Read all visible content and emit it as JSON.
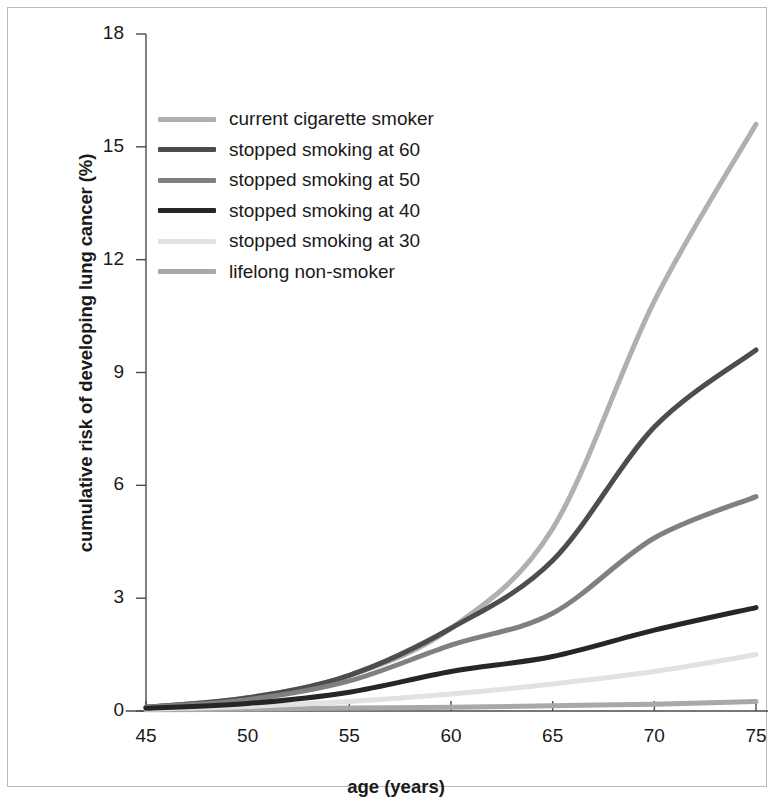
{
  "chart_data": {
    "type": "line",
    "title": "",
    "xlabel": "age (years)",
    "ylabel": "cumulative risk of developing lung cancer (%)",
    "xlim": [
      43,
      76
    ],
    "ylim": [
      0,
      18
    ],
    "xticks": [
      "45",
      "50",
      "55",
      "60",
      "65",
      "70",
      "75"
    ],
    "xtick_values": [
      45,
      50,
      55,
      60,
      65,
      70,
      75
    ],
    "yticks": [
      "0",
      "3",
      "6",
      "9",
      "12",
      "15",
      "18"
    ],
    "ytick_values": [
      0,
      3,
      6,
      9,
      12,
      15,
      18
    ],
    "grid": false,
    "legend_position": "upper-left",
    "x": [
      45,
      50,
      55,
      60,
      65,
      70,
      75
    ],
    "series": [
      {
        "name": "current cigarette smoker",
        "color": "#b0b0b0",
        "values": [
          0.1,
          0.35,
          0.95,
          2.2,
          4.85,
          10.9,
          15.6
        ]
      },
      {
        "name": "stopped smoking at 60",
        "color": "#4d4d4d",
        "values": [
          0.1,
          0.35,
          0.95,
          2.2,
          4.0,
          7.55,
          9.6
        ]
      },
      {
        "name": "stopped smoking at 50",
        "color": "#808080",
        "values": [
          0.1,
          0.3,
          0.8,
          1.75,
          2.6,
          4.6,
          5.7
        ]
      },
      {
        "name": "stopped smoking at 40",
        "color": "#262626",
        "values": [
          0.07,
          0.2,
          0.5,
          1.05,
          1.45,
          2.15,
          2.75
        ]
      },
      {
        "name": "stopped smoking at 30",
        "color": "#e2e2e2",
        "values": [
          0.05,
          0.12,
          0.25,
          0.45,
          0.72,
          1.05,
          1.5
        ]
      },
      {
        "name": "lifelong non-smoker",
        "color": "#a8a8a8",
        "values": [
          0.03,
          0.05,
          0.08,
          0.1,
          0.14,
          0.18,
          0.25
        ]
      }
    ]
  },
  "legend": {
    "items": [
      {
        "label": "current cigarette smoker",
        "color": "#b0b0b0"
      },
      {
        "label": "stopped smoking at 60",
        "color": "#4d4d4d"
      },
      {
        "label": "stopped smoking at 50",
        "color": "#808080"
      },
      {
        "label": "stopped smoking at 40",
        "color": "#262626"
      },
      {
        "label": "stopped smoking at 30",
        "color": "#e2e2e2"
      },
      {
        "label": "lifelong non-smoker",
        "color": "#a8a8a8"
      }
    ]
  },
  "axis": {
    "line_color": "#4a4a4a",
    "text_color": "#1a1a1a"
  }
}
